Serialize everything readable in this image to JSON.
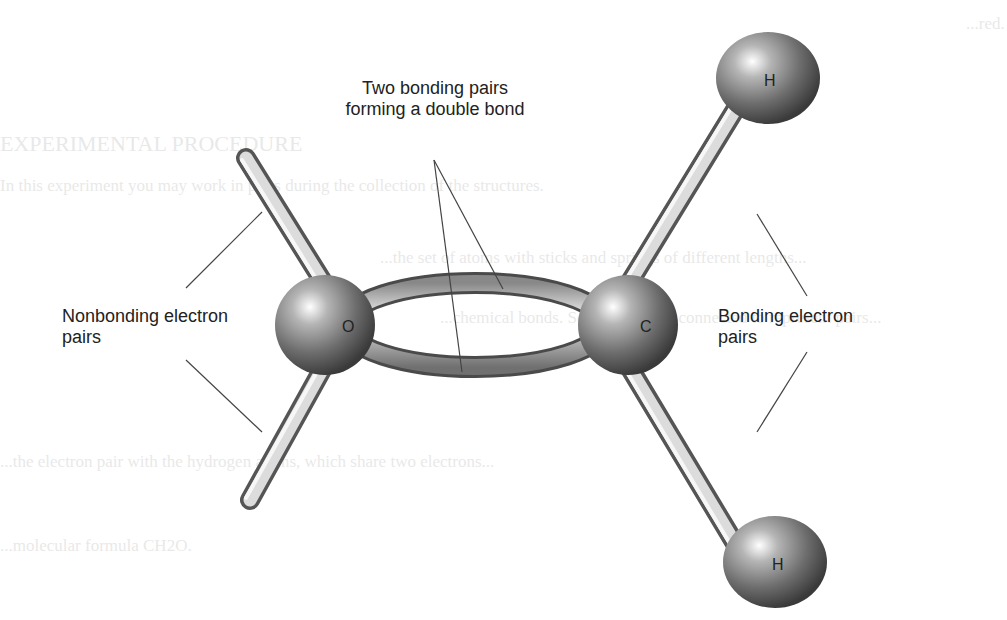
{
  "figure": {
    "atoms": [
      {
        "symbol": "O",
        "label": "O"
      },
      {
        "symbol": "C",
        "label": "C"
      },
      {
        "symbol": "H",
        "label": "H"
      },
      {
        "symbol": "H",
        "label": "H"
      }
    ],
    "labels": {
      "double_bond_line1": "Two bonding pairs",
      "double_bond_line2": "forming a double bond",
      "nonbonding_line1": "Nonbonding electron",
      "nonbonding_line2": "pairs",
      "bonding_line1": "Bonding electron",
      "bonding_line2": "pairs"
    }
  },
  "background_bleed": {
    "line_top": "...red.",
    "heading": "EXPERIMENTAL PROCEDURE",
    "para1": "In this experiment you may work in pairs during the collection of the structures.",
    "para2": "...the set of atoms with sticks and springs of different lengths...",
    "para3": "...chemical bonds. Some sticks are connected to represent pairs...",
    "para4": "...the electron pair with the hydrogen atoms, which share two electrons...",
    "para5": "...molecular formula CH2O."
  }
}
